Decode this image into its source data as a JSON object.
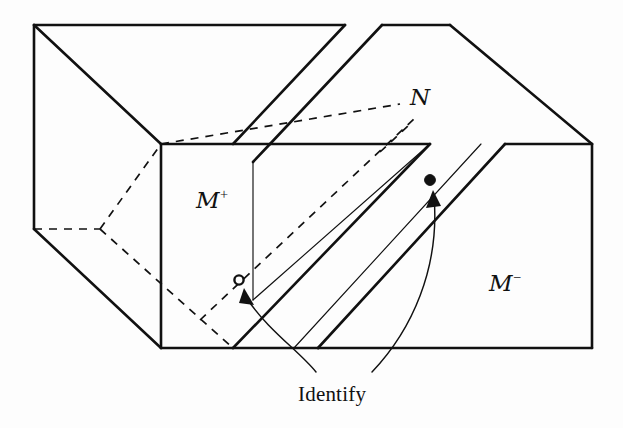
{
  "figure": {
    "background_color": "#fdfdfd",
    "stroke_color": "#111111",
    "labels": {
      "m_plus": {
        "base": "M",
        "exponent": "+",
        "text": "M+",
        "x": 196,
        "y": 187
      },
      "m_minus": {
        "base": "M",
        "exponent": "−",
        "text": "M−",
        "x": 489,
        "y": 270
      },
      "n_surface": {
        "text": "N",
        "x": 410,
        "y": 86
      },
      "identify": {
        "text": "Identify",
        "x": 298,
        "y": 384
      }
    },
    "markers": {
      "open_point": {
        "x": 239,
        "y": 280,
        "radius": 5,
        "fill": "#fdfdfd",
        "stroke": "#111111",
        "style": "open-circle"
      },
      "filled_point": {
        "x": 430,
        "y": 180,
        "radius": 5.5,
        "fill": "#111111",
        "stroke": "#111111",
        "style": "filled-dot"
      }
    },
    "annotation_arrows": [
      {
        "name": "identify-arrow-to-open-point",
        "from_x": 318,
        "from_y": 372,
        "to_x": 245,
        "to_y": 290
      },
      {
        "name": "identify-arrow-to-filled-point",
        "from_x": 370,
        "from_y": 372,
        "to_x": 434,
        "to_y": 190
      }
    ],
    "solid_edges": [
      {
        "name": "left-block-top-left-vertical",
        "points": "34,25 34,229"
      },
      {
        "name": "left-block-top-back-horizontal",
        "points": "34,25 345,25"
      },
      {
        "name": "left-block-top-front-diagonal",
        "points": "34,25 161,144"
      },
      {
        "name": "left-block-front-vertical",
        "points": "161,144 161,348"
      },
      {
        "name": "left-block-left-lower-diagonal",
        "points": "34,229 161,348"
      },
      {
        "name": "left-block-top-right-horizontal",
        "points": "161,144 430,144"
      },
      {
        "name": "left-block-bottom-horizontal",
        "points": "161,348 233,348"
      },
      {
        "name": "notch-upper-left-diagonal",
        "points": "345,25 233,144"
      },
      {
        "name": "notch-vertex-to-front",
        "points": "233,348 430,144"
      },
      {
        "name": "right-block-top-back-horizontal",
        "points": "382,25 450,25"
      },
      {
        "name": "right-block-top-left-diagonal",
        "points": "382,25 270,144"
      },
      {
        "name": "right-block-upper-diagonal",
        "points": "450,25 592,144"
      },
      {
        "name": "right-block-right-vertical",
        "points": "592,144 592,348"
      },
      {
        "name": "right-block-bottom-horizontal",
        "points": "318,348 592,348"
      },
      {
        "name": "right-block-front-diagonal",
        "points": "318,348 505,144"
      },
      {
        "name": "right-block-front-top-horizontal",
        "points": "505,144 592,144"
      },
      {
        "name": "slot-inner-diagonal-upper",
        "points": "270,144 253,162"
      },
      {
        "name": "slot-lower-wall",
        "points": "233,348 318,348"
      }
    ],
    "thin_edges": [
      {
        "name": "slot-interior-fold-left",
        "points": "253,300 380,162"
      },
      {
        "name": "slot-interior-fold-right",
        "points": "318,348 505,144"
      },
      {
        "name": "slot-interior-crease",
        "points": "430,144 253,300"
      }
    ],
    "dashed_edges": [
      {
        "name": "hidden-back-vertical",
        "points": "100,229 100,90"
      },
      {
        "name": "hidden-back-horizontal",
        "points": "34,229 100,229"
      },
      {
        "name": "hidden-back-diagonal-up",
        "points": "100,229 161,144"
      },
      {
        "name": "hidden-interior-diagonal",
        "points": "100,229 233,348"
      },
      {
        "name": "hidden-long-diagonal",
        "points": "161,144 395,110"
      },
      {
        "name": "hidden-main-diagonal",
        "points": "233,348 430,144"
      }
    ]
  }
}
